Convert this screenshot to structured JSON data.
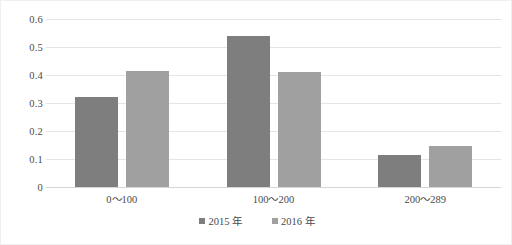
{
  "chart_data": {
    "type": "bar",
    "title": "",
    "subtitle": "",
    "xlabel": "",
    "ylabel": "",
    "categories": [
      "0～100",
      "100～200",
      "200～289"
    ],
    "series": [
      {
        "name": "2015 年",
        "values": [
          0.32,
          0.54,
          0.115
        ],
        "color": "#7e7e7e"
      },
      {
        "name": "2016 年",
        "values": [
          0.415,
          0.41,
          0.148
        ],
        "color": "#a0a0a0"
      }
    ],
    "ylim": [
      0,
      0.6
    ],
    "ytick_values": [
      0.6,
      0.5,
      0.4,
      0.3,
      0.2,
      0.1,
      0
    ],
    "ytick_labels": [
      "0.6",
      "0.5",
      "0.4",
      "0.3",
      "0.2",
      "0.1",
      "0"
    ],
    "grid": true,
    "legend_position": "bottom",
    "annotations": []
  },
  "legend": {
    "items": [
      {
        "label": "2015 年",
        "marker": "square-marker-icon"
      },
      {
        "label": "2016 年",
        "marker": "square-marker-icon"
      }
    ]
  },
  "colors": {
    "series_2015": "#7e7e7e",
    "series_2016": "#a0a0a0",
    "gridline": "#e4e4e4",
    "baseline": "#d6d6d6",
    "text": "#4a4a4a",
    "background": "#ffffff",
    "border": "#efefef"
  }
}
